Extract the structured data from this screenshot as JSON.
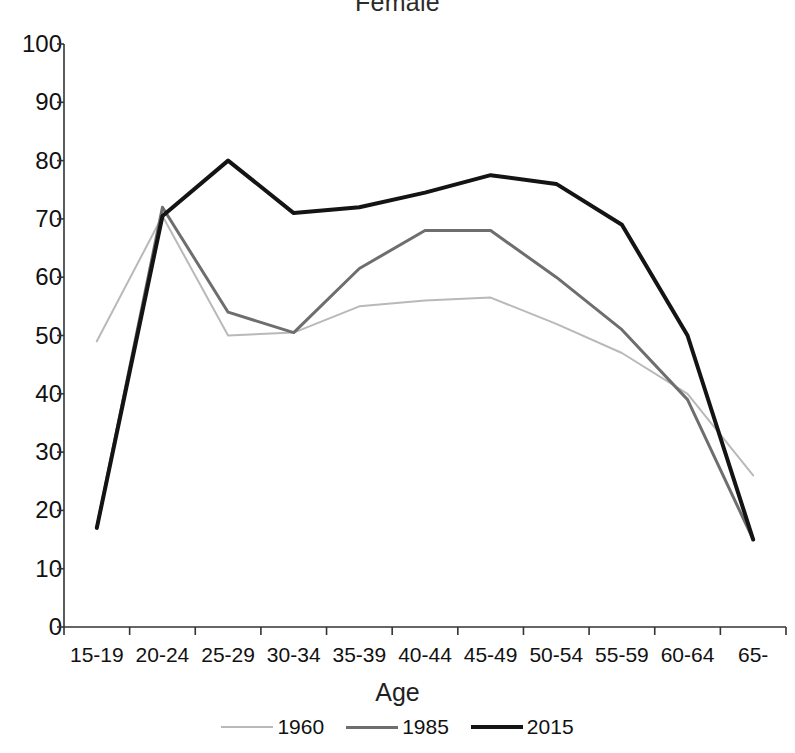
{
  "chart_data": {
    "type": "line",
    "title": "Female",
    "xlabel": "Age",
    "ylabel": "",
    "categories": [
      "15-19",
      "20-24",
      "25-29",
      "30-34",
      "35-39",
      "40-44",
      "45-49",
      "50-54",
      "55-59",
      "60-64",
      "65-"
    ],
    "ylim": [
      0,
      100
    ],
    "y_ticks": [
      0,
      10,
      20,
      30,
      40,
      50,
      60,
      70,
      80,
      90,
      100
    ],
    "grid": false,
    "legend_position": "bottom",
    "series": [
      {
        "name": "1960",
        "color": "#b9b9b9",
        "width": 2,
        "values": [
          49,
          70.5,
          50,
          50.5,
          55,
          56,
          56.5,
          52,
          47,
          40,
          26
        ]
      },
      {
        "name": "1985",
        "color": "#6e6e6e",
        "width": 3,
        "values": [
          17,
          72,
          54,
          50.5,
          61.5,
          68,
          68,
          60,
          51,
          39,
          15
        ]
      },
      {
        "name": "2015",
        "color": "#141414",
        "width": 4,
        "values": [
          17,
          70.5,
          80,
          71,
          72,
          74.5,
          77.5,
          76,
          69,
          50,
          15
        ]
      }
    ]
  },
  "legend": {
    "items": [
      {
        "label": "1960"
      },
      {
        "label": "1985"
      },
      {
        "label": "2015"
      }
    ]
  }
}
